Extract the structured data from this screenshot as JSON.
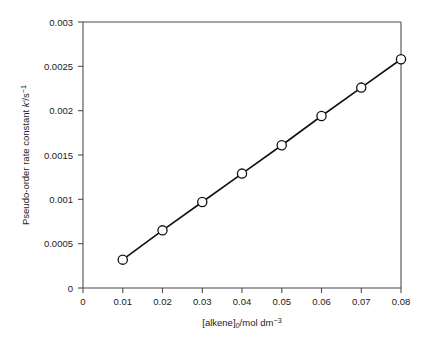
{
  "chart_data": {
    "type": "line",
    "title": "",
    "subtitle": "",
    "xlabel": "[alkene]0/mol dm-3",
    "ylabel": "Pseudo-order rate constant k'/s-1",
    "xlim": [
      0,
      0.08
    ],
    "ylim": [
      0,
      0.003
    ],
    "grid": false,
    "legend": false,
    "legend_position": "none",
    "markers": "open-circle",
    "x": [
      0.01,
      0.02,
      0.03,
      0.04,
      0.05,
      0.06,
      0.07,
      0.08
    ],
    "values": [
      0.00032,
      0.00065,
      0.00097,
      0.00129,
      0.00161,
      0.00194,
      0.00226,
      0.00258
    ],
    "series": [
      {
        "name": "pseudo-order rate constant",
        "x": [
          0.01,
          0.02,
          0.03,
          0.04,
          0.05,
          0.06,
          0.07,
          0.08
        ],
        "values": [
          0.00032,
          0.00065,
          0.00097,
          0.00129,
          0.00161,
          0.00194,
          0.00226,
          0.00258
        ]
      }
    ],
    "xticks": [
      0,
      0.01,
      0.02,
      0.03,
      0.04,
      0.05,
      0.06,
      0.07,
      0.08
    ],
    "xticklabels": [
      "0",
      "0.01",
      "0.02",
      "0.03",
      "0.04",
      "0.05",
      "0.06",
      "0.07",
      "0.08"
    ],
    "yticks": [
      0,
      0.0005,
      0.001,
      0.0015,
      0.002,
      0.0025,
      0.003
    ],
    "yticklabels": [
      "0",
      "0.0005",
      "0.001",
      "0.0015",
      "0.002",
      "0.0025",
      "0.003"
    ],
    "annotations": []
  },
  "axes": {
    "x_title": {
      "bracket_open": "[",
      "species": "alkene",
      "bracket_close": "]",
      "subscript": "0",
      "units": "/mol dm",
      "units_superscript": "−3"
    },
    "y_title": {
      "text": "Pseudo-order rate constant ",
      "symbol": "k′",
      "units": "/s",
      "units_superscript": "−1"
    }
  },
  "colors": {
    "background": "#ffffff",
    "axis": "#4d4d4d",
    "line": "#111111",
    "marker_fill": "#ffffff",
    "marker_edge": "#111111",
    "text": "#1a1a1a"
  }
}
